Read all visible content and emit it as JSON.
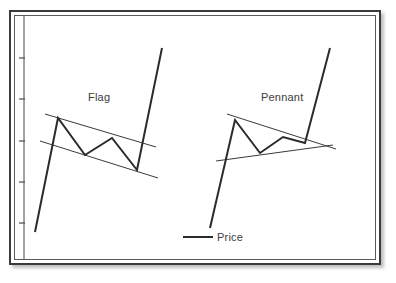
{
  "figure": {
    "background_color": "#ffffff",
    "frame_color": "#3b3b3b",
    "inner_frame_color": "#5a5a5a",
    "line_color": "#2b2b2b",
    "trendline_color": "#3a3a3a",
    "text_color": "#3c3c3c"
  },
  "labels": {
    "flag": "Flag",
    "pennant": "Pennant"
  },
  "legend": {
    "entry_label": "Price",
    "position": "bottom-center"
  },
  "chart_data": {
    "type": "line",
    "title": "",
    "subtitle": "",
    "xlabel": "",
    "ylabel": "",
    "grid": false,
    "legend_position": "bottom-center",
    "axis": {
      "y_ticks_count": 5,
      "y_tick_labels": [],
      "x_tick_labels": [],
      "x_axis_visible": false,
      "y_axis_visible": true
    },
    "annotations": [
      {
        "text": "Flag",
        "x": 88,
        "y": 97
      },
      {
        "text": "Pennant",
        "x": 261,
        "y": 97
      }
    ],
    "series": [
      {
        "name": "Price",
        "pattern": "Flag",
        "description": "Steep advance pole, downward-sloping parallel channel consolidation, then upward breakout",
        "points": [
          {
            "x": 35,
            "y": 232
          },
          {
            "x": 58,
            "y": 118
          },
          {
            "x": 85,
            "y": 155
          },
          {
            "x": 112,
            "y": 138
          },
          {
            "x": 137,
            "y": 170
          },
          {
            "x": 162,
            "y": 48
          }
        ]
      },
      {
        "name": "Price",
        "pattern": "Pennant",
        "description": "Steep advance pole, converging symmetrical-triangle consolidation, then upward breakout",
        "points": [
          {
            "x": 210,
            "y": 228
          },
          {
            "x": 235,
            "y": 120
          },
          {
            "x": 260,
            "y": 153
          },
          {
            "x": 283,
            "y": 137
          },
          {
            "x": 305,
            "y": 143
          },
          {
            "x": 330,
            "y": 48
          }
        ]
      }
    ],
    "trendlines": [
      {
        "name": "flag-upper-channel",
        "pattern": "Flag",
        "slope": "down",
        "x1": 45,
        "y1": 114,
        "x2": 156,
        "y2": 147
      },
      {
        "name": "flag-lower-channel",
        "pattern": "Flag",
        "slope": "down",
        "x1": 40,
        "y1": 141,
        "x2": 158,
        "y2": 178
      },
      {
        "name": "pennant-upper-trendline",
        "pattern": "Pennant",
        "slope": "down",
        "x1": 227,
        "y1": 114,
        "x2": 336,
        "y2": 149
      },
      {
        "name": "pennant-lower-trendline",
        "pattern": "Pennant",
        "slope": "up",
        "x1": 216,
        "y1": 161,
        "x2": 333,
        "y2": 145
      }
    ]
  }
}
